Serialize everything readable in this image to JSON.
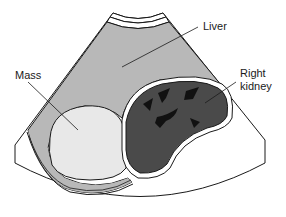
{
  "diagram": {
    "type": "ultrasound-illustration",
    "labels": {
      "liver": "Liver",
      "mass": "Mass",
      "kidney_line1": "Right",
      "kidney_line2": "kidney"
    },
    "colors": {
      "background": "#ffffff",
      "liver": "#b8b8b8",
      "mass": "#e8e8e8",
      "kidney": "#4a4a4a",
      "sinus": "#111111",
      "outline": "#1a1a1a"
    }
  }
}
